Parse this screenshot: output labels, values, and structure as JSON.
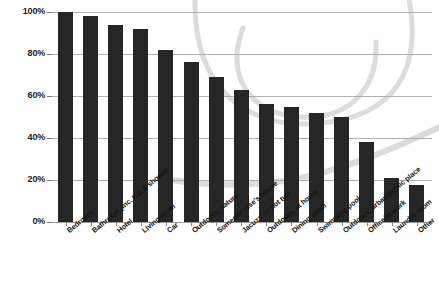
{
  "chart_data": {
    "type": "bar",
    "title": "",
    "subtitle": "",
    "xlabel": "",
    "ylabel": "",
    "ylim": [
      0,
      100
    ],
    "ytick_labels": [
      "0%",
      "20%",
      "40%",
      "60%",
      "80%",
      "100%"
    ],
    "ytick_values": [
      0,
      20,
      40,
      60,
      80,
      100
    ],
    "grid": true,
    "legend": "none",
    "value_suffix": "%",
    "categories": [
      "Bedroom",
      "Bathroom (inc. tub & shower",
      "Hotel",
      "Living room",
      "Car",
      "Outdoors, nature",
      "Someone else's house",
      "Jacuzzi or hot tub",
      "Outdoors, at home",
      "Dining room",
      "Swimming pool",
      "Outdoors, urban/public place",
      "Office/at work",
      "Laundry room",
      "Other"
    ],
    "values": [
      100,
      98,
      94,
      92,
      82,
      76,
      69,
      63,
      56,
      55,
      52,
      50,
      38,
      21,
      17.5
    ]
  },
  "style": {
    "bar_color": "#262626",
    "gridline_color": "#b0b0b0",
    "background_color": "#ffffff",
    "swoosh_color": "#dcdcdc",
    "text_color": "#141414"
  }
}
